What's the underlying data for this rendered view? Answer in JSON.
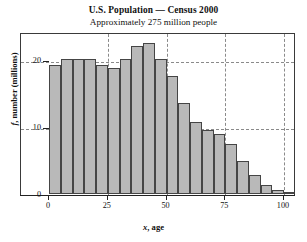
{
  "chart_data": {
    "type": "bar",
    "title": "U.S. Population — Census 2000",
    "subtitle": "Approximately 275 million people",
    "xlabel": "x, age",
    "xlabel_var": "x",
    "xlabel_rest": ", age",
    "ylabel": "f, number (millions)",
    "ylabel_var": "f",
    "ylabel_rest": ", number (millions)",
    "xlim": [
      0,
      110
    ],
    "ylim": [
      0,
      24
    ],
    "bin_width": 5,
    "grid": true,
    "legend": "none",
    "xticks": [
      0,
      25,
      50,
      75,
      100
    ],
    "xtick_labels": [
      "0",
      "25",
      "50",
      "75",
      "100"
    ],
    "yticks": [
      0,
      10,
      20
    ],
    "ytick_labels": [
      "0",
      "10",
      "20"
    ],
    "bin_starts": [
      0,
      5,
      10,
      15,
      20,
      25,
      30,
      35,
      40,
      45,
      50,
      55,
      60,
      65,
      70,
      75,
      80,
      85,
      90,
      95,
      100
    ],
    "categories": [
      "0-5",
      "5-10",
      "10-15",
      "15-20",
      "20-25",
      "25-30",
      "30-35",
      "35-40",
      "40-45",
      "45-50",
      "50-55",
      "55-60",
      "60-65",
      "65-70",
      "70-75",
      "75-80",
      "80-85",
      "85-90",
      "90-95",
      "95-100",
      "100-105"
    ],
    "values": [
      19.2,
      20.1,
      20.2,
      20.2,
      19.2,
      18.8,
      20.2,
      22.1,
      22.6,
      20.1,
      17.6,
      13.6,
      10.8,
      9.5,
      8.9,
      7.4,
      5.0,
      2.9,
      1.3,
      0.6,
      0.3
    ],
    "bar_fill_color": "#b9b9b9",
    "bar_edge_color": "#454545",
    "gridline_color": "#8a8a8a",
    "frame_color": "#3a3a3a"
  }
}
